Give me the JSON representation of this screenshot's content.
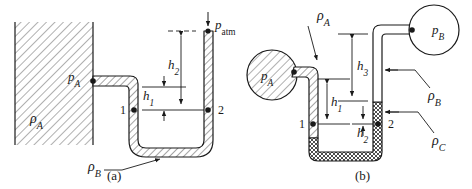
{
  "figure": {
    "background_color": "#ffffff",
    "line_color": "#1a1a1a"
  },
  "panels": [
    {
      "id": "panel-a",
      "caption": "(a)",
      "description": "Open U-tube manometer attached to a hatched wall reservoir, open to atmosphere",
      "labels": {
        "reservoir_density": "ρ",
        "reservoir_density_sub": "A",
        "reservoir_pressure": "p",
        "reservoir_pressure_sub": "A",
        "manometer_fluid": "ρ",
        "manometer_fluid_sub": "B",
        "atmosphere_pressure": "p",
        "atmosphere_pressure_sub": "atm",
        "height_1": "h",
        "height_1_sub": "1",
        "height_2": "h",
        "height_2_sub": "2",
        "point_1": "1",
        "point_2": "2"
      }
    },
    {
      "id": "panel-b",
      "caption": "(b)",
      "description": "Differential U-tube manometer connecting two pressure vessels p_A and p_B with three fluids",
      "labels": {
        "vessel_a_pressure": "p",
        "vessel_a_pressure_sub": "A",
        "vessel_b_pressure": "p",
        "vessel_b_pressure_sub": "B",
        "fluid_a_density": "ρ",
        "fluid_a_density_sub": "A",
        "fluid_b_density": "ρ",
        "fluid_b_density_sub": "B",
        "fluid_c_density": "ρ",
        "fluid_c_density_sub": "C",
        "height_1": "h",
        "height_1_sub": "1",
        "height_2": "h",
        "height_2_sub": "2",
        "height_3": "h",
        "height_3_sub": "3",
        "point_1": "1",
        "point_2": "2"
      }
    }
  ]
}
